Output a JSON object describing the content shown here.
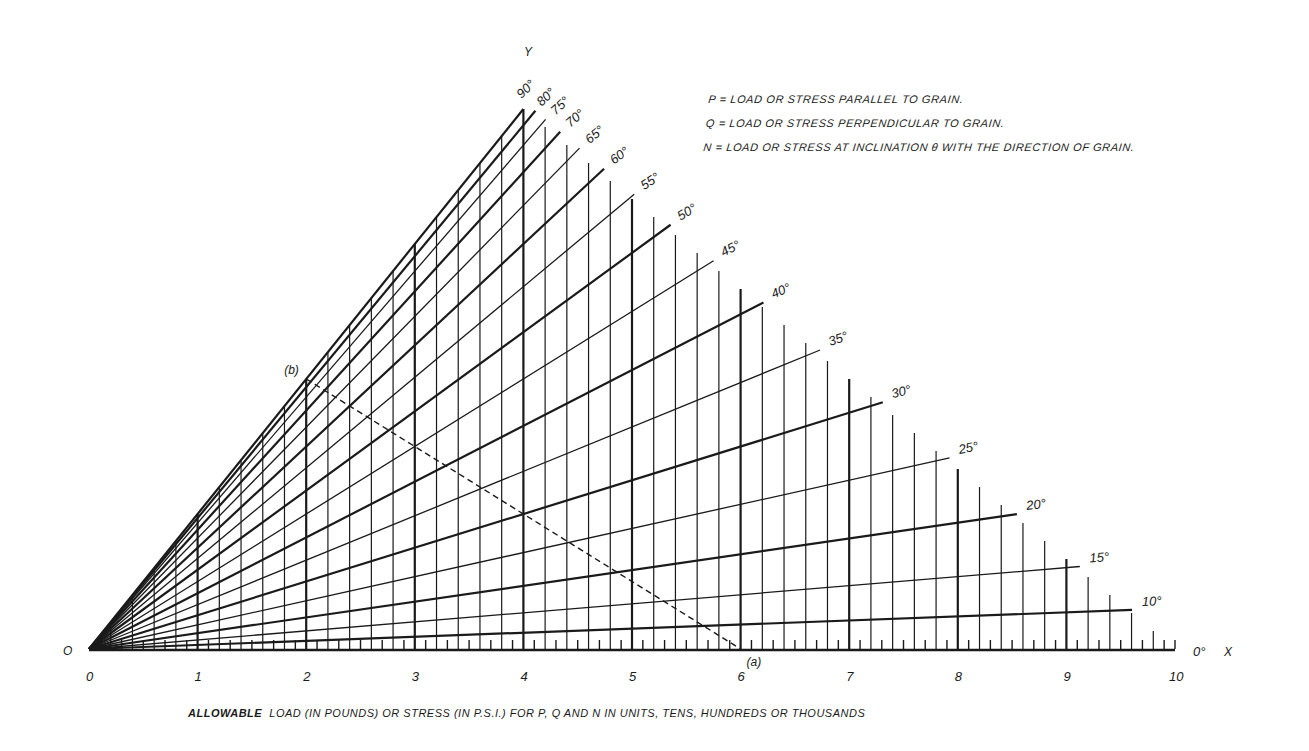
{
  "chart_data": {
    "type": "nomograph",
    "xlabel": "ALLOWABLE LOAD (IN POUNDS) OR STRESS (IN P.S.I.) FOR P, Q AND N IN UNITS, TENS, HUNDREDS OR THOUSANDS",
    "x_axis_name": "X",
    "y_axis_name": "Y",
    "origin_label": "O",
    "x_ticks": [
      0,
      1,
      2,
      3,
      4,
      5,
      6,
      7,
      8,
      9,
      10
    ],
    "xlim": [
      0,
      10
    ],
    "minor_grid_step": 0.2,
    "tick_step": 0.1,
    "angle_lines_deg": [
      0,
      10,
      15,
      20,
      25,
      30,
      35,
      40,
      45,
      50,
      55,
      60,
      65,
      70,
      75,
      80,
      90
    ],
    "angle_labels": [
      "0°",
      "10°",
      "15°",
      "20°",
      "25°",
      "30°",
      "35°",
      "40°",
      "45°",
      "50°",
      "55°",
      "60°",
      "65°",
      "70°",
      "75°",
      "80°",
      "90°"
    ],
    "angle_line_slope_rule": "slope = k * sin^2(theta), k = slope of 90° line",
    "q_line_top_x": 4,
    "example": {
      "point_a_label": "(a)",
      "point_a_x": 6,
      "point_b_label": "(b)",
      "point_b_x": 2,
      "line_style": "dashed"
    },
    "legend": [
      "P = LOAD OR STRESS PARALLEL TO GRAIN.",
      "Q = LOAD OR STRESS PERPENDICULAR TO GRAIN.",
      "N = LOAD OR STRESS AT INCLINATION θ WITH THE DIRECTION OF GRAIN."
    ],
    "grid": true
  },
  "notes": {
    "p": "P = LOAD OR STRESS PARALLEL TO GRAIN.",
    "q": "Q = LOAD OR STRESS PERPENDICULAR TO GRAIN.",
    "n": "N = LOAD OR STRESS AT INCLINATION θ WITH THE DIRECTION OF GRAIN."
  },
  "caption": {
    "bold": "ALLOWABLE",
    "rest": "  LOAD (IN POUNDS) OR STRESS (IN P.S.I.) FOR P, Q AND N IN UNITS, TENS, HUNDREDS OR THOUSANDS"
  },
  "colors": {
    "ink": "#1a1a1a",
    "paper": "#ffffff"
  }
}
